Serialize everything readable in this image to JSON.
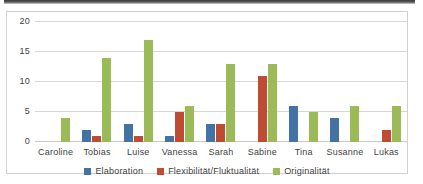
{
  "chart_data": {
    "type": "bar",
    "title": "",
    "subtitle": "",
    "xlabel": "",
    "ylabel": "",
    "ylim": [
      0,
      20
    ],
    "yticks": [
      0,
      5,
      10,
      15,
      20
    ],
    "grid": true,
    "legend_position": "bottom",
    "categories": [
      "Caroline",
      "Tobias",
      "Luise",
      "Vanessa",
      "Sarah",
      "Sabine",
      "Tina",
      "Susanne",
      "Lukas"
    ],
    "series": [
      {
        "name": "Elaboration",
        "color": "#4472A4",
        "values": [
          0,
          2,
          3,
          1,
          3,
          0,
          6,
          4,
          0
        ]
      },
      {
        "name": "Flexibilität/Fluktualität",
        "color": "#BE4B32",
        "values": [
          0,
          1,
          1,
          5,
          3,
          11,
          0,
          0,
          2
        ]
      },
      {
        "name": "Originalität",
        "color": "#9BBB59",
        "values": [
          4,
          14,
          17,
          6,
          13,
          13,
          5,
          6,
          6
        ]
      }
    ]
  },
  "axis": {
    "yticks": [
      "20",
      "15",
      "10",
      "5",
      "0"
    ]
  },
  "legend": {
    "items": [
      {
        "label": "Elaboration",
        "color": "#4472A4"
      },
      {
        "label": "Flexibilität/Fluktualität",
        "color": "#BE4B32"
      },
      {
        "label": "Originalität",
        "color": "#9BBB59"
      }
    ]
  }
}
